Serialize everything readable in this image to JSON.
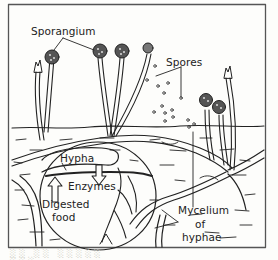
{
  "figure": {
    "labels": {
      "sporangium": "Sporangium",
      "spores": "Spores",
      "hypha": "Hypha",
      "enzymes": "Enzymes",
      "digested_food": "Digested",
      "digested_food_2": "food",
      "mycelium": "Mycelium",
      "mycelium_2": "of",
      "mycelium_3": "hyphae"
    },
    "caption": "░░ ░░ ░░░░░ ░░░"
  },
  "colors": {
    "ink": "#222222",
    "paper": "#fdfdfb",
    "frame": "#555555"
  }
}
